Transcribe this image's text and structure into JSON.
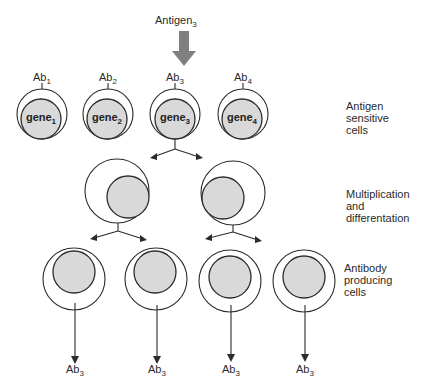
{
  "top": {
    "antigen_label": "Antigen",
    "antigen_sub": "3",
    "antigen_arrow_color": "#808080"
  },
  "row1": {
    "cells": [
      {
        "ab": "Ab",
        "ab_sub": "1",
        "gene": "gene",
        "gene_sub": "1"
      },
      {
        "ab": "Ab",
        "ab_sub": "2",
        "gene": "gene",
        "gene_sub": "2"
      },
      {
        "ab": "Ab",
        "ab_sub": "3",
        "gene": "gene",
        "gene_sub": "3"
      },
      {
        "ab": "Ab",
        "ab_sub": "4",
        "gene": "gene",
        "gene_sub": "4"
      }
    ],
    "side_label": [
      "Antigen",
      "sensitive",
      "cells"
    ]
  },
  "row2": {
    "side_label": [
      "Multiplication",
      "and",
      "differentation"
    ]
  },
  "row3": {
    "outputs": [
      {
        "ab": "Ab",
        "ab_sub": "3"
      },
      {
        "ab": "Ab",
        "ab_sub": "3"
      },
      {
        "ab": "Ab",
        "ab_sub": "3"
      },
      {
        "ab": "Ab",
        "ab_sub": "3"
      }
    ],
    "side_label": [
      "Antibody",
      "producing",
      "cells"
    ]
  },
  "colors": {
    "nucleus_fill": "#d9d9d9",
    "stroke": "#2b2b2b",
    "background": "#ffffff"
  }
}
